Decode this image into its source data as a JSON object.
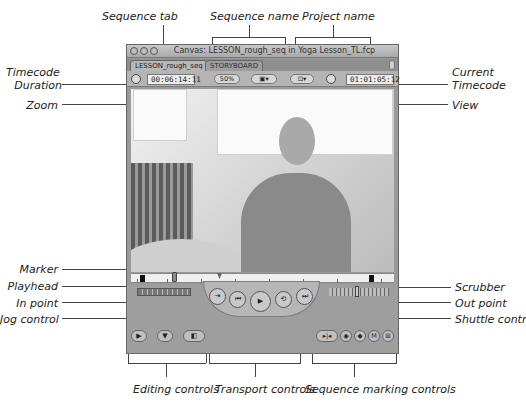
{
  "callouts": {
    "sequence_tab": "Sequence tab",
    "sequence_name": "Sequence name",
    "project_name": "Project name",
    "timecode_duration_line1": "Timecode",
    "timecode_duration_line2": "Duration",
    "zoom": "Zoom",
    "current_timecode_line1": "Current",
    "current_timecode_line2": "Timecode",
    "view": "View",
    "marker": "Marker",
    "playhead": "Playhead",
    "in_point": "In point",
    "jog_control": "Jog control",
    "scrubber": "Scrubber",
    "out_point": "Out point",
    "shuttle_control": "Shuttle control",
    "editing_controls": "Editing controls",
    "transport_controls": "Transport controls",
    "sequence_marking_controls": "Sequence marking controls"
  },
  "window": {
    "title": "Canvas: LESSON_rough_seq in Yoga Lesson_TL.fcp",
    "tabs": [
      {
        "label": "LESSON_rough_seq",
        "active": true
      },
      {
        "label": "STORYBOARD",
        "active": false
      }
    ],
    "timecode_duration": "00:06:14:11",
    "zoom_value": "50%",
    "view_mode_icon": "view-mode",
    "view_icon": "overlay",
    "current_timecode": "01:01:05:12"
  },
  "transport": {
    "buttons": [
      {
        "name": "play-in-to-out",
        "glyph": "⇥"
      },
      {
        "name": "previous-edit",
        "glyph": "⏮"
      },
      {
        "name": "play",
        "glyph": "▶"
      },
      {
        "name": "play-around",
        "glyph": "⟲"
      },
      {
        "name": "next-edit",
        "glyph": "⏭"
      }
    ]
  },
  "editing": {
    "buttons": [
      {
        "name": "insert",
        "glyph": "▶"
      },
      {
        "name": "overwrite",
        "glyph": "▼"
      },
      {
        "name": "replace",
        "glyph": "◧"
      }
    ]
  },
  "marking": {
    "buttons": [
      {
        "name": "mark-in-out",
        "glyph": "▸|◂"
      },
      {
        "name": "mark-clip",
        "glyph": "◉"
      },
      {
        "name": "add-keyframe",
        "glyph": "◆"
      },
      {
        "name": "add-marker",
        "glyph": "M"
      },
      {
        "name": "match-frame",
        "glyph": "⊞"
      }
    ]
  },
  "colors": {
    "window_bg": "#9a9a9a",
    "scrubber_bg": "#f0f0f0"
  }
}
